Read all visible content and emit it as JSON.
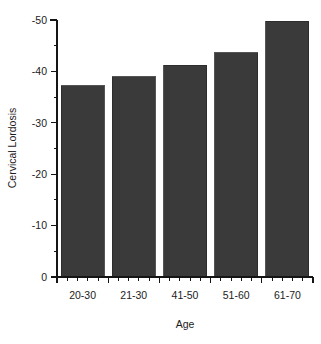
{
  "chart_data": {
    "type": "bar",
    "title": "",
    "subtitle": "",
    "xlabel": "Age",
    "ylabel": "Cervical Lordosis",
    "categories": [
      "20-30",
      "21-30",
      "41-50",
      "51-60",
      "61-70"
    ],
    "values": [
      -37.2,
      -39.0,
      -41.2,
      -43.6,
      -49.8
    ],
    "series": [
      {
        "name": "Cervical Lordosis",
        "values": [
          -37.2,
          -39.0,
          -41.2,
          -43.6,
          -49.8
        ]
      }
    ],
    "ylim": [
      0,
      -50
    ],
    "y_axis_inverted": true,
    "y_ticks": [
      0,
      -10,
      -20,
      -30,
      -40,
      -50
    ],
    "y_tick_labels": [
      "0",
      "-10",
      "-20",
      "-30",
      "-40",
      "-50"
    ],
    "y_minor_tick_interval": 5,
    "x_minor_ticks_per_category": 4,
    "grid": false,
    "legend": false,
    "legend_position": "none",
    "bar_color": "#3a3a3a",
    "bar_edge_color": "#2a2a2a",
    "axis_color": "#151515",
    "background_color": "#ffffff",
    "annotations": []
  },
  "figure": {
    "plot_area": {
      "left": 57,
      "right": 313,
      "top": 20,
      "bottom": 277
    },
    "bar_width": 43,
    "bar_gap": 7
  }
}
